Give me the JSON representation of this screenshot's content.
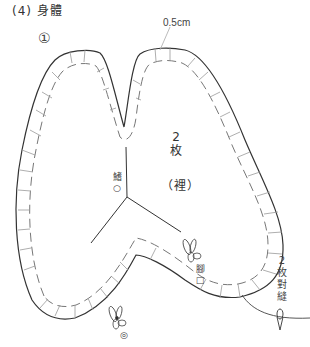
{
  "diagram": {
    "title": "(4) 身體",
    "piece_number": "①",
    "seam_allowance_label": "0.5cm",
    "piece_count": [
      "2",
      "枚"
    ],
    "side_label": "（裡）",
    "markers": {
      "fin": [
        "鰭",
        "○"
      ],
      "foot": [
        "腳",
        "□"
      ],
      "mouth": [
        "嘴",
        "◎"
      ]
    },
    "joining_note": [
      "2",
      "枚",
      "對",
      "縫"
    ],
    "colors": {
      "outline": "#333333",
      "seam_allowance": "#888888",
      "background": "#ffffff"
    }
  }
}
